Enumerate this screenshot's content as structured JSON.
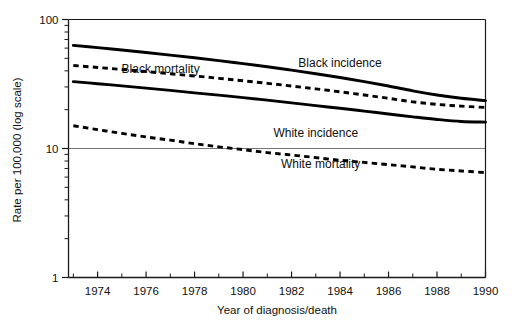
{
  "chart_data": {
    "type": "line",
    "title": "",
    "subtitle": "",
    "xlabel": "Year of diagnosis/death",
    "ylabel": "Rate per 100,000 (log scale)",
    "yscale": "log",
    "ylim": [
      1,
      100
    ],
    "xlim": [
      1972.8,
      1990
    ],
    "grid": "horizontal-at-decades",
    "legend_position": "inline-annotations",
    "y_tick_labels": [
      "100",
      "10",
      "1"
    ],
    "y_tick_values": [
      100,
      10,
      1
    ],
    "y_minor_ticks": [
      90,
      80,
      70,
      60,
      50,
      40,
      30,
      20,
      9,
      8,
      7,
      6,
      5,
      4,
      3,
      2
    ],
    "x_tick_labels": [
      "1974",
      "1976",
      "1978",
      "1980",
      "1982",
      "1984",
      "1986",
      "1988",
      "1990"
    ],
    "x_tick_values": [
      1974,
      1976,
      1978,
      1980,
      1982,
      1984,
      1986,
      1988,
      1990
    ],
    "x_minor_ticks": [
      1973,
      1975,
      1977,
      1979,
      1981,
      1983,
      1985,
      1987,
      1989
    ],
    "x": [
      1973,
      1974,
      1975,
      1976,
      1977,
      1978,
      1979,
      1980,
      1981,
      1982,
      1983,
      1984,
      1985,
      1986,
      1987,
      1988,
      1989,
      1990
    ],
    "series": [
      {
        "name": "Black incidence",
        "style": "solid",
        "color": "#000000",
        "label_x": 1984.0,
        "label_y": 46.0,
        "values": [
          63.0,
          60.5,
          58.0,
          55.5,
          53.0,
          50.5,
          48.0,
          45.5,
          43.0,
          40.5,
          38.0,
          35.5,
          33.0,
          30.5,
          28.0,
          26.0,
          24.5,
          23.5
        ]
      },
      {
        "name": "Black mortality",
        "style": "dashed",
        "color": "#000000",
        "label_x": 1976.6,
        "label_y": 41.0,
        "values": [
          44.0,
          42.5,
          41.0,
          39.5,
          38.0,
          36.5,
          35.0,
          33.5,
          32.0,
          30.5,
          29.0,
          27.5,
          26.0,
          24.5,
          23.0,
          22.0,
          21.3,
          20.8
        ]
      },
      {
        "name": "White incidence",
        "style": "solid",
        "color": "#000000",
        "label_x": 1983.0,
        "label_y": 13.2,
        "values": [
          33.0,
          31.8,
          30.6,
          29.4,
          28.2,
          27.0,
          25.9,
          24.8,
          23.7,
          22.6,
          21.5,
          20.5,
          19.5,
          18.5,
          17.6,
          16.8,
          16.2,
          16.0
        ]
      },
      {
        "name": "White mortality",
        "style": "dashed",
        "color": "#000000",
        "label_x": 1983.2,
        "label_y": 7.6,
        "values": [
          15.0,
          14.0,
          13.1,
          12.3,
          11.6,
          10.9,
          10.3,
          9.8,
          9.3,
          8.9,
          8.5,
          8.1,
          7.8,
          7.5,
          7.2,
          6.9,
          6.7,
          6.5
        ]
      }
    ]
  }
}
